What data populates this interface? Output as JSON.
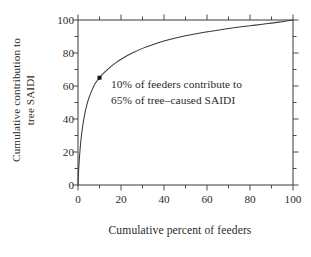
{
  "chart_data": {
    "type": "line",
    "title": "",
    "xlabel": "Cumulative percent of feeders",
    "ylabel_line1": "Cumulative contribution to",
    "ylabel_line2": "tree SAIDI",
    "xlim": [
      0,
      100
    ],
    "ylim": [
      0,
      100
    ],
    "xticks": [
      0,
      20,
      40,
      60,
      80,
      100
    ],
    "yticks": [
      0,
      20,
      40,
      60,
      80,
      100
    ],
    "xtick_labels": [
      "0",
      "20",
      "40",
      "60",
      "80",
      "100"
    ],
    "ytick_labels": [
      "0",
      "20",
      "40",
      "60",
      "80",
      "100"
    ],
    "minor_tick_step": 10,
    "grid": false,
    "legend": null,
    "series": [
      {
        "name": "Cumulative tree-caused SAIDI",
        "x": [
          0.0,
          0.3,
          0.7,
          1.2,
          2.0,
          3.0,
          4.0,
          5.0,
          6.5,
          8.0,
          10.0,
          12.5,
          15.0,
          18.0,
          21.0,
          25.0,
          30.0,
          35.0,
          40.0,
          45.0,
          50.0,
          55.0,
          60.0,
          65.0,
          70.0,
          75.0,
          80.0,
          85.0,
          90.0,
          95.0,
          100.0
        ],
        "y": [
          0.0,
          9.0,
          17.0,
          25.0,
          34.0,
          42.0,
          48.0,
          52.5,
          57.5,
          61.5,
          65.0,
          68.5,
          71.5,
          74.5,
          77.0,
          79.8,
          82.8,
          85.2,
          87.2,
          88.9,
          90.4,
          91.7,
          92.8,
          93.8,
          94.8,
          95.7,
          96.5,
          97.3,
          98.1,
          99.0,
          100.0
        ]
      }
    ],
    "markers": [
      {
        "name": "highlight-point",
        "x": 10,
        "y": 65,
        "shape": "square",
        "size": 4
      }
    ],
    "annotations": [
      {
        "name": "callout-text",
        "line1": "10% of feeders contribute to",
        "line2": "65% of tree–caused SAIDI",
        "x": 15,
        "y": 62
      }
    ],
    "colors": {
      "background": "#ffffff",
      "axis": "#4a4a4a",
      "curve": "#3a3a3a",
      "text": "#2b2b2b",
      "marker": "#111111"
    }
  }
}
